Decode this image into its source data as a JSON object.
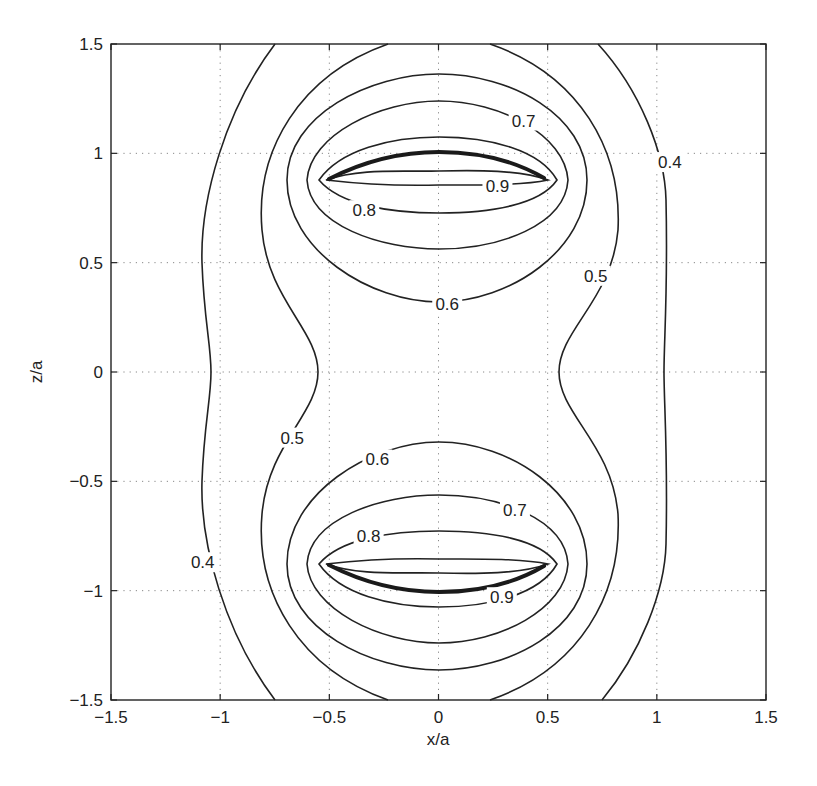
{
  "chart_data": {
    "type": "contour",
    "title": "",
    "xlabel": "x/a",
    "ylabel": "z/a",
    "xlim": [
      -1.5,
      1.5
    ],
    "ylim": [
      -1.5,
      1.5
    ],
    "grid": true,
    "xticks": [
      -1.5,
      -1,
      -0.5,
      0,
      0.5,
      1,
      1.5
    ],
    "yticks": [
      -1.5,
      -1,
      -0.5,
      0,
      0.5,
      1,
      1.5
    ],
    "xtick_labels": [
      "−1.5",
      "−1",
      "−0.5",
      "0",
      "0.5",
      "1",
      "1.5"
    ],
    "ytick_labels": [
      "−1.5",
      "−1",
      "−0.5",
      "0",
      "0.5",
      "1",
      "1.5"
    ],
    "contour_levels": [
      0.4,
      0.5,
      0.6,
      0.7,
      0.8,
      0.9
    ],
    "sources": [
      {
        "name": "upper-ring-arc",
        "x_range": [
          -0.5,
          0.5
        ],
        "z_at_center": 1.0,
        "z_at_ends": 0.88
      },
      {
        "name": "lower-ring-arc",
        "x_range": [
          -0.5,
          0.5
        ],
        "z_at_center": -1.0,
        "z_at_ends": -0.88
      }
    ],
    "contour_labels": [
      {
        "text": "0.7",
        "x": 0.39,
        "z": 1.15
      },
      {
        "text": "0.4",
        "x": 1.06,
        "z": 0.96
      },
      {
        "text": "0.9",
        "x": 0.27,
        "z": 0.85
      },
      {
        "text": "0.8",
        "x": -0.34,
        "z": 0.74
      },
      {
        "text": "0.5",
        "x": 0.72,
        "z": 0.44
      },
      {
        "text": "0.6",
        "x": 0.04,
        "z": 0.31
      },
      {
        "text": "0.5",
        "x": -0.67,
        "z": -0.3
      },
      {
        "text": "0.6",
        "x": -0.28,
        "z": -0.4
      },
      {
        "text": "0.7",
        "x": 0.35,
        "z": -0.63
      },
      {
        "text": "0.8",
        "x": -0.32,
        "z": -0.75
      },
      {
        "text": "0.4",
        "x": -1.08,
        "z": -0.87
      },
      {
        "text": "0.9",
        "x": 0.29,
        "z": -1.03
      }
    ]
  },
  "layout": {
    "plot": {
      "left": 111,
      "top": 44,
      "right": 766,
      "bottom": 700
    },
    "upper_contours": [
      {
        "level": "0.9",
        "d": "M326,180 C360,168 400,172 439,171 S520,170 548,180 C520,186 470,185 439,185 C400,186 360,184 326,180 Z"
      },
      {
        "level": "0.8",
        "d": "M319,180 C340,150 390,137 439,137 C490,137 540,150 557,180 C540,205 490,213 439,213 C390,213 340,205 319,180 Z"
      },
      {
        "level": "0.7",
        "d": "M307,180 C310,135 380,101 439,101 C500,101 565,135 568,180 C565,225 500,249 439,249 C380,249 310,225 307,180 Z"
      },
      {
        "level": "0.6",
        "d": "M287,180 C287,115 370,74 439,74 C510,74 587,115 587,180 C587,250 510,302 439,302 C370,302 287,250 287,180 Z"
      }
    ],
    "outer_contours": [
      {
        "level": "0.5",
        "d": "M388,44 C300,75 255,150 262,230 C268,300 318,330 318,372 C318,414 268,444 262,514 C255,594 300,669 388,700 M490,44 C580,75 622,150 618,230 C612,300 559,330 559,372 C559,414 612,444 618,514 C622,594 580,669 490,700"
      },
      {
        "level": "0.4",
        "d": "M275,44 C225,110 200,200 202,263 C204,320 211,345 211,372 C211,399 204,424 202,481 C200,544 225,634 275,700 M598,44 C640,90 665,153 666,200 C668,290 664,340 664,372 C664,404 668,454 666,544 C665,591 640,654 602,700"
      }
    ],
    "source_paths": [
      "M329,179 C370,158 405,152 439,152 C475,152 510,158 544,178",
      "M329,565 C370,586 405,592 439,592 C475,592 510,586 544,566"
    ]
  }
}
